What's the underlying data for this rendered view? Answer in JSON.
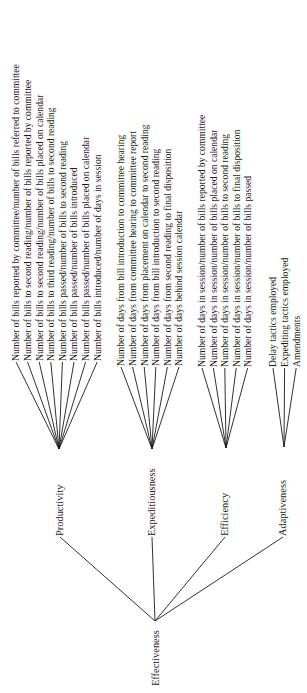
{
  "root": {
    "label": "Effectiveness",
    "x": 155,
    "y": 621
  },
  "branches": [
    {
      "label": "Productivity",
      "node_x": 59,
      "node_y": 537,
      "apex_x": 59,
      "apex_y": 449,
      "leaves": [
        "Number of bills reported by committee/number of bills referred to committee",
        "Number of bills to second reading/number of bills reported by committee",
        "Number of bills to second reading/number of bills placed on calendar",
        "Number of bills to third reading/number of bills to second reading",
        "Number of bills passed/number of bills to second reading",
        "Number of bills passed/number of bills introduced",
        "Number of bills passed/number of bills placed on calendar",
        "Number of bills introduced/number of days in session"
      ],
      "leaf_x_start": 16,
      "leaf_x_step": 11.6,
      "leaf_y": 362
    },
    {
      "label": "Expeditiousness",
      "node_x": 151,
      "node_y": 537,
      "apex_x": 152,
      "apex_y": 449,
      "leaves": [
        "Number of days from bill introduction to committee hearing",
        "Number of days from committee hearing to committee report",
        "Number of days from placement on calendar to second reading",
        "Number of days from bill introduction to second reading",
        "Number of days from second reading to final disposition",
        "Number of days behind session calendar"
      ],
      "leaf_x_start": 121,
      "leaf_x_step": 11.6,
      "leaf_y": 367
    },
    {
      "label": "Efficiency",
      "node_x": 224,
      "node_y": 537,
      "apex_x": 226,
      "apex_y": 448,
      "leaves": [
        "Number of days in session/number of bills reported by committee",
        "Number of days in session/number of bills placed on calendar",
        "Number of days in session/number of bills to second reading",
        "Number of days in session/number of bills to final disposition",
        "Number of days in session/number of bills passed"
      ],
      "leaf_x_start": 202,
      "leaf_x_step": 11.4,
      "leaf_y": 368
    },
    {
      "label": "Adaptiveness",
      "node_x": 282,
      "node_y": 537,
      "apex_x": 284,
      "apex_y": 447,
      "leaves": [
        "Delay tactics employed",
        "Expediting tactics employed",
        "Amendments"
      ],
      "leaf_x_start": 273,
      "leaf_x_step": 11.6,
      "leaf_y": 368
    }
  ]
}
